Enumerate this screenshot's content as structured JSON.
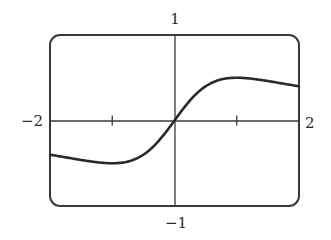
{
  "chart_data": {
    "type": "line",
    "title": "",
    "xlabel": "",
    "ylabel": "",
    "function": "x/(x^2+1)",
    "xlim": [
      -2,
      2
    ],
    "ylim": [
      -1,
      1
    ],
    "x_ticks": [
      -1,
      1
    ],
    "grid": false,
    "legend": "none",
    "axis_labels": {
      "x_min": "−2",
      "x_max": "2",
      "y_max": "1",
      "y_min": "−1"
    },
    "series": [
      {
        "name": "f(x)",
        "x": [
          -2,
          -1.5,
          -1,
          -0.5,
          0,
          0.5,
          1,
          1.5,
          2
        ],
        "y": [
          -0.4,
          -0.46,
          -0.5,
          -0.4,
          0,
          0.4,
          0.5,
          0.46,
          0.4
        ]
      }
    ],
    "colors": {
      "curve": "#2a2a2a",
      "frame": "#3a3a3a",
      "axes": "#3a3a3a"
    }
  }
}
